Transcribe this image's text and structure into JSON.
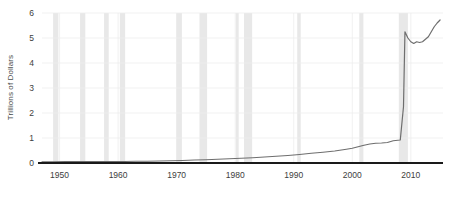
{
  "chart_data": {
    "type": "line",
    "title": "",
    "subtitle": "",
    "xlabel": "",
    "ylabel": "Trillions of Dollars",
    "xlim": [
      1947,
      2015.5
    ],
    "ylim": [
      0,
      6
    ],
    "grid": true,
    "legend": null,
    "x_ticks": [
      "1950",
      "1960",
      "1970",
      "1980",
      "1990",
      "2000",
      "2010"
    ],
    "x_tick_values": [
      1950,
      1960,
      1970,
      1980,
      1990,
      2000,
      2010
    ],
    "y_ticks": [
      "0",
      "1",
      "2",
      "3",
      "4",
      "5",
      "6"
    ],
    "y_tick_values": [
      0,
      1,
      2,
      3,
      4,
      5,
      6
    ],
    "line_color": "#6e6e6e",
    "axis_color": "#1a1a1a",
    "grid_color": "#ededed",
    "band_color": "#e8e8e8",
    "series": [
      {
        "name": "Total Assets",
        "x": [
          1947,
          1949,
          1951,
          1953,
          1955,
          1957,
          1959,
          1961,
          1963,
          1965,
          1967,
          1969,
          1971,
          1973,
          1975,
          1977,
          1979,
          1981,
          1983,
          1985,
          1987,
          1989,
          1991,
          1993,
          1995,
          1997,
          1999,
          2000,
          2001,
          2002,
          2003,
          2004,
          2005,
          2006,
          2007,
          2008.2,
          2008.75,
          2009,
          2009.5,
          2010,
          2010.5,
          2011,
          2011.5,
          2012,
          2012.5,
          2013,
          2013.5,
          2014,
          2014.5,
          2015
        ],
        "y": [
          0.05,
          0.05,
          0.06,
          0.06,
          0.06,
          0.06,
          0.06,
          0.06,
          0.07,
          0.07,
          0.08,
          0.09,
          0.1,
          0.12,
          0.13,
          0.15,
          0.17,
          0.19,
          0.21,
          0.24,
          0.27,
          0.3,
          0.34,
          0.39,
          0.43,
          0.48,
          0.55,
          0.59,
          0.65,
          0.71,
          0.76,
          0.79,
          0.8,
          0.82,
          0.89,
          0.92,
          2.25,
          5.25,
          5.0,
          4.85,
          4.78,
          4.85,
          4.82,
          4.85,
          4.95,
          5.05,
          5.25,
          5.45,
          5.6,
          5.72
        ]
      }
    ],
    "recession_bands": [
      {
        "start": 1948.9,
        "end": 1949.8
      },
      {
        "start": 1953.5,
        "end": 1954.4
      },
      {
        "start": 1957.6,
        "end": 1958.4
      },
      {
        "start": 1960.3,
        "end": 1961.2
      },
      {
        "start": 1969.9,
        "end": 1970.9
      },
      {
        "start": 1973.9,
        "end": 1975.2
      },
      {
        "start": 1980.1,
        "end": 1980.6
      },
      {
        "start": 1981.5,
        "end": 1982.9
      },
      {
        "start": 1990.6,
        "end": 1991.2
      },
      {
        "start": 2001.2,
        "end": 2001.9
      },
      {
        "start": 2007.95,
        "end": 2009.5
      }
    ]
  },
  "accessibility": {
    "chart_description": "Line chart of Trillions of Dollars from 1950 to 2015 with recession shading"
  }
}
